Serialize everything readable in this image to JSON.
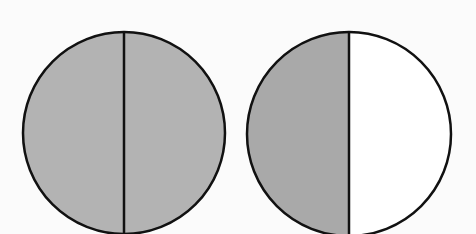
{
  "diagram": {
    "type": "fraction-circles",
    "colors": {
      "shaded": "#b3b3b3",
      "unshaded": "#ffffff",
      "stroke": "#111111",
      "background": "#fbfbfb"
    },
    "circles": [
      {
        "id": "circle-1",
        "parts": 2,
        "shaded_parts": 2,
        "cx": 124,
        "cy": 133,
        "r": 101
      },
      {
        "id": "circle-2",
        "parts": 2,
        "shaded_parts": 1,
        "cx": 349,
        "cy": 134,
        "r": 102
      }
    ]
  }
}
